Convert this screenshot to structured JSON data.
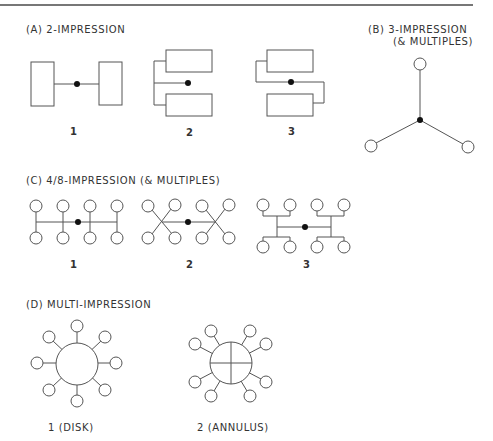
{
  "sections": {
    "a": {
      "title": "(A)  2-IMPRESSION",
      "labels": [
        "1",
        "2",
        "3"
      ]
    },
    "b": {
      "title_line1": "(B)  3-IMPRESSION",
      "title_line2": "(& MULTIPLES)"
    },
    "c": {
      "title": "(C)  4/8-IMPRESSION (& MULTIPLES)",
      "labels": [
        "1",
        "2",
        "3"
      ]
    },
    "d": {
      "title": "(D)  MULTI-IMPRESSION",
      "labels": [
        "1 (DISK)",
        "2 (ANNULUS)"
      ]
    }
  },
  "colors": {
    "line": "#555555",
    "dot": "#111111",
    "background": "#ffffff"
  }
}
